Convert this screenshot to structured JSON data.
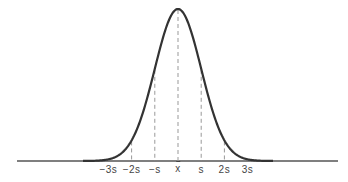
{
  "chart_data": {
    "type": "line",
    "title": "",
    "xlabel": "",
    "ylabel": "",
    "x_ticks": [
      {
        "label": "−3s",
        "value": -3
      },
      {
        "label": "−2s",
        "value": -2
      },
      {
        "label": "−s",
        "value": -1
      },
      {
        "label": "x",
        "value": 0,
        "is_mean": true
      },
      {
        "label": "s",
        "value": 1
      },
      {
        "label": "2s",
        "value": 2
      },
      {
        "label": "3s",
        "value": 3
      }
    ],
    "series": [
      {
        "name": "normal density",
        "x": [
          -3.5,
          -3,
          -2,
          -1,
          0,
          1,
          2,
          3,
          3.5
        ],
        "values": [
          0.0009,
          0.0044,
          0.054,
          0.242,
          0.399,
          0.242,
          0.054,
          0.0044,
          0.0009
        ]
      }
    ],
    "reference_lines": "dashed vertical lines at each tick",
    "grid": false,
    "legend": null
  },
  "colors": {
    "curve": "#333333",
    "dashed": "#999999",
    "baseline": "#555555"
  }
}
